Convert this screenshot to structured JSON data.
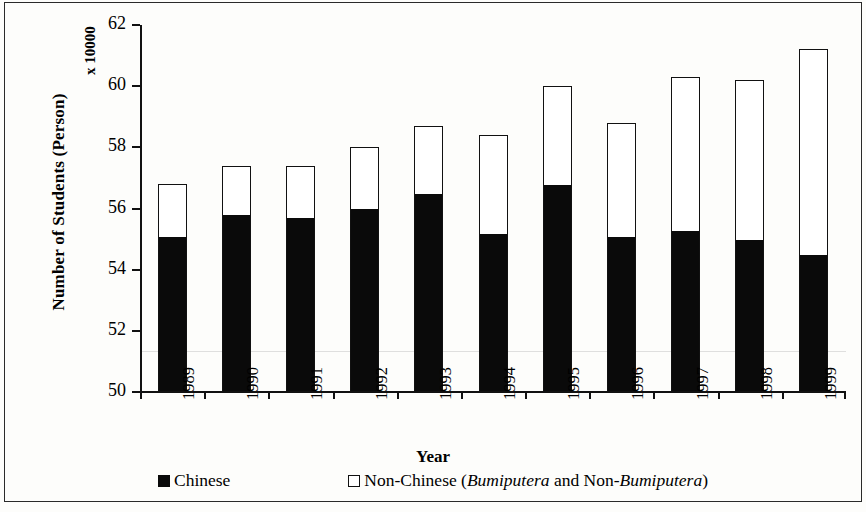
{
  "chart_data": {
    "type": "bar",
    "subtype": "stacked",
    "title": "",
    "xlabel": "Year",
    "ylabel": "Number of Students (Person)",
    "y_multiplier_label": "x 10000",
    "ylim": [
      50,
      62
    ],
    "ytick_values": [
      50,
      52,
      54,
      56,
      58,
      60,
      62
    ],
    "ytick_labels": [
      "50",
      "52",
      "54",
      "56",
      "58",
      "60",
      "62"
    ],
    "grid": false,
    "legend_position": "bottom",
    "categories": [
      "1989",
      "1990",
      "1991",
      "1992",
      "1993",
      "1994",
      "1995",
      "1996",
      "1997",
      "1998",
      "1999"
    ],
    "series": [
      {
        "name": "Chinese",
        "style": "filled-black",
        "color": "#0a0a0a",
        "values": [
          55.1,
          55.8,
          55.7,
          56.0,
          56.5,
          55.2,
          56.8,
          55.1,
          55.3,
          55.0,
          54.5
        ]
      },
      {
        "name": "Non-Chinese (Bumiputera and Non-Bumiputera)",
        "style": "open-white",
        "color": "#ffffff",
        "values": [
          1.7,
          1.6,
          1.7,
          2.0,
          2.2,
          3.2,
          3.2,
          3.7,
          5.0,
          5.2,
          6.7
        ]
      }
    ],
    "totals": [
      56.8,
      57.4,
      57.4,
      58.0,
      58.7,
      58.4,
      60.0,
      58.8,
      60.3,
      60.2,
      61.2
    ]
  },
  "axes": {
    "y_title": "Number of Students (Person)",
    "y_multiplier": "x 10000",
    "x_title": "Year"
  },
  "legend": {
    "items": [
      {
        "swatch": "filled-black-square",
        "label_html": "Chinese"
      },
      {
        "swatch": "open-white-square",
        "label_html": "Non-Chinese (<i>Bumiputera</i> and Non-<i>Bumiputera</i>)"
      }
    ]
  }
}
